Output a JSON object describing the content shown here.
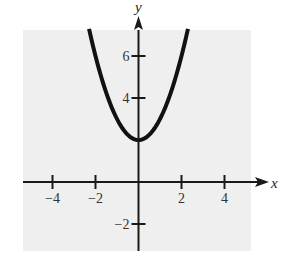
{
  "chart_data": {
    "type": "line",
    "title": "",
    "xlabel": "x",
    "ylabel": "y",
    "function": "y = x^2 + 2",
    "xlim": [
      -5,
      6
    ],
    "ylim": [
      -3,
      7.5
    ],
    "grid": false,
    "legend": null,
    "x_ticks": [
      -4,
      -2,
      2,
      4
    ],
    "x_tick_labels": [
      "−4",
      "−2",
      "2",
      "4"
    ],
    "y_ticks": [
      -2,
      4,
      6
    ],
    "y_tick_labels": [
      "−2",
      "4",
      "6"
    ],
    "series": [
      {
        "name": "parabola",
        "x": [
          -2.3,
          -2,
          -1.5,
          -1,
          -0.5,
          0,
          0.5,
          1,
          1.5,
          2,
          2.3
        ],
        "y": [
          7.29,
          6,
          4.25,
          3,
          2.25,
          2,
          2.25,
          3,
          4.25,
          6,
          7.29
        ]
      }
    ],
    "vertex": [
      0,
      2
    ]
  },
  "colors": {
    "panel": "#efefef",
    "curve": "#111111",
    "axes": "#1a1a1a"
  }
}
